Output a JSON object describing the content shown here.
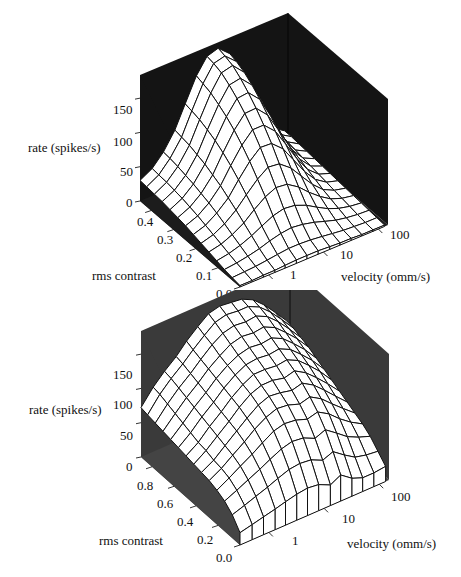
{
  "chart_data": [
    {
      "type": "surface",
      "title": "",
      "panel": "top",
      "xlabel": "velocity (omm/s)",
      "ylabel": "rms contrast",
      "zlabel": "rate (spikes/s)",
      "x_scale": "log",
      "x_ticks": [
        "1",
        "10",
        "100"
      ],
      "y_ticks": [
        "0.0",
        "0.1",
        "0.2",
        "0.3",
        "0.4"
      ],
      "z_ticks": [
        "0",
        "50",
        "100",
        "150"
      ],
      "xlim": [
        0.3,
        150
      ],
      "ylim": [
        0.0,
        0.45
      ],
      "zlim": [
        0,
        175
      ],
      "wall_color": "#141414",
      "floor_color": "#1c1c1c",
      "x": [
        0.3,
        0.5,
        0.8,
        1.3,
        2,
        3.2,
        5,
        8,
        13,
        20,
        32,
        50,
        80,
        130
      ],
      "y": [
        0.0,
        0.035,
        0.07,
        0.105,
        0.14,
        0.175,
        0.21,
        0.245,
        0.28,
        0.315,
        0.35,
        0.385,
        0.42,
        0.45
      ],
      "z": [
        [
          2,
          2,
          3,
          3,
          4,
          5,
          5,
          5,
          4,
          3,
          3,
          2,
          2,
          2
        ],
        [
          4,
          5,
          6,
          8,
          10,
          12,
          12,
          11,
          9,
          7,
          5,
          4,
          3,
          3
        ],
        [
          6,
          8,
          11,
          15,
          20,
          24,
          26,
          24,
          20,
          15,
          10,
          7,
          5,
          4
        ],
        [
          9,
          12,
          17,
          24,
          32,
          40,
          44,
          42,
          35,
          26,
          17,
          11,
          7,
          5
        ],
        [
          12,
          16,
          23,
          33,
          46,
          58,
          65,
          63,
          52,
          38,
          25,
          15,
          9,
          6
        ],
        [
          15,
          20,
          29,
          42,
          58,
          74,
          85,
          83,
          70,
          52,
          33,
          19,
          11,
          7
        ],
        [
          18,
          24,
          35,
          50,
          70,
          90,
          104,
          103,
          88,
          66,
          42,
          24,
          13,
          8
        ],
        [
          21,
          28,
          40,
          58,
          81,
          104,
          120,
          120,
          104,
          79,
          51,
          29,
          15,
          9
        ],
        [
          23,
          31,
          44,
          64,
          90,
          116,
          134,
          135,
          118,
          91,
          60,
          34,
          17,
          10
        ],
        [
          25,
          34,
          48,
          70,
          98,
          126,
          146,
          148,
          131,
          102,
          68,
          38,
          19,
          11
        ],
        [
          27,
          36,
          51,
          74,
          104,
          134,
          156,
          159,
          142,
          112,
          75,
          42,
          21,
          12
        ],
        [
          28,
          38,
          54,
          78,
          109,
          141,
          164,
          168,
          151,
          120,
          81,
          45,
          23,
          13
        ],
        [
          29,
          39,
          56,
          80,
          112,
          145,
          168,
          172,
          157,
          126,
          86,
          48,
          24,
          14
        ],
        [
          30,
          40,
          57,
          82,
          114,
          148,
          170,
          175,
          160,
          130,
          88,
          49,
          25,
          14
        ]
      ]
    },
    {
      "type": "surface",
      "title": "",
      "panel": "bottom",
      "xlabel": "velocity (omm/s)",
      "ylabel": "rms contrast",
      "zlabel": "rate (spikes/s)",
      "x_scale": "log",
      "x_ticks": [
        "1",
        "10",
        "100"
      ],
      "y_ticks": [
        "0.0",
        "0.2",
        "0.4",
        "0.6",
        "0.8"
      ],
      "z_ticks": [
        "0",
        "50",
        "100",
        "150"
      ],
      "xlim": [
        0.3,
        150
      ],
      "ylim": [
        0.0,
        0.9
      ],
      "zlim": [
        0,
        175
      ],
      "wall_color": "#3a3a3a",
      "floor_color": "#444444",
      "x": [
        0.3,
        0.5,
        0.8,
        1.3,
        2,
        3.2,
        5,
        8,
        13,
        20,
        32,
        50,
        80,
        130
      ],
      "y": [
        0.0,
        0.07,
        0.14,
        0.21,
        0.28,
        0.35,
        0.42,
        0.49,
        0.56,
        0.63,
        0.7,
        0.77,
        0.84,
        0.9
      ],
      "z": [
        [
          18,
          22,
          26,
          30,
          34,
          38,
          40,
          38,
          30,
          38,
          26,
          20,
          20,
          22
        ],
        [
          34,
          40,
          46,
          52,
          58,
          64,
          66,
          64,
          56,
          62,
          50,
          40,
          36,
          34
        ],
        [
          44,
          52,
          60,
          68,
          76,
          84,
          88,
          86,
          78,
          84,
          72,
          60,
          52,
          46
        ],
        [
          50,
          60,
          70,
          80,
          90,
          100,
          104,
          102,
          96,
          100,
          90,
          76,
          64,
          54
        ],
        [
          54,
          64,
          76,
          88,
          100,
          110,
          116,
          114,
          108,
          112,
          102,
          88,
          74,
          60
        ],
        [
          56,
          66,
          80,
          94,
          106,
          118,
          124,
          122,
          118,
          122,
          112,
          98,
          82,
          66
        ],
        [
          58,
          70,
          84,
          98,
          112,
          124,
          130,
          130,
          126,
          130,
          120,
          106,
          90,
          72
        ],
        [
          60,
          72,
          88,
          102,
          116,
          128,
          136,
          136,
          134,
          136,
          128,
          114,
          98,
          78
        ],
        [
          62,
          76,
          92,
          106,
          120,
          132,
          140,
          142,
          140,
          142,
          134,
          120,
          104,
          84
        ],
        [
          64,
          80,
          96,
          110,
          124,
          136,
          144,
          148,
          146,
          148,
          140,
          126,
          110,
          90
        ],
        [
          66,
          84,
          100,
          114,
          128,
          140,
          150,
          154,
          152,
          154,
          146,
          132,
          116,
          96
        ],
        [
          68,
          88,
          104,
          118,
          132,
          146,
          156,
          160,
          158,
          160,
          152,
          138,
          120,
          100
        ],
        [
          70,
          92,
          108,
          122,
          136,
          150,
          162,
          166,
          164,
          164,
          156,
          142,
          124,
          104
        ],
        [
          72,
          94,
          110,
          124,
          140,
          154,
          166,
          170,
          168,
          166,
          158,
          144,
          126,
          106
        ]
      ]
    }
  ],
  "panels": {
    "top": {
      "zlabel": "rate (spikes/s)",
      "ylabel": "rms contrast",
      "xlabel": "velocity (omm/s)",
      "z_ticks": [
        "150",
        "100",
        "50",
        "0"
      ],
      "y_ticks": [
        "0.4",
        "0.3",
        "0.2",
        "0.1",
        "0.0"
      ],
      "x_ticks": [
        "1",
        "10",
        "100"
      ]
    },
    "bottom": {
      "zlabel": "rate (spikes/s)",
      "ylabel": "rms contrast",
      "xlabel": "velocity (omm/s)",
      "z_ticks": [
        "150",
        "100",
        "50",
        "0"
      ],
      "y_ticks": [
        "0.8",
        "0.6",
        "0.4",
        "0.2",
        "0.0"
      ],
      "x_ticks": [
        "1",
        "10",
        "100"
      ]
    }
  }
}
